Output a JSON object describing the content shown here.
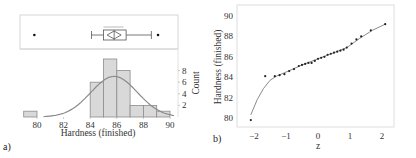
{
  "chart_data": [
    {
      "panel": "a)",
      "type": "bar",
      "title": "",
      "xlabel": "Hardness (finished)",
      "ylabel": "Count",
      "x_ticks": [
        "80",
        "82",
        "84",
        "86",
        "88",
        "90"
      ],
      "y_ticks": [
        "2",
        "4",
        "6",
        "8"
      ],
      "xlim": [
        78.5,
        90.3
      ],
      "ylim": [
        0,
        11
      ],
      "bins": [
        {
          "from": 79,
          "to": 80,
          "count": 1
        },
        {
          "from": 84,
          "to": 85,
          "count": 6
        },
        {
          "from": 85,
          "to": 86,
          "count": 10
        },
        {
          "from": 86,
          "to": 87,
          "count": 8
        },
        {
          "from": 87,
          "to": 88,
          "count": 2
        },
        {
          "from": 88,
          "to": 89,
          "count": 2
        },
        {
          "from": 89,
          "to": 90,
          "count": 1
        }
      ],
      "normal_fit": {
        "mean": 85.8,
        "sd": 1.75,
        "peak_count": 7
      },
      "boxplot": {
        "whisker_low": 84.1,
        "q1": 85.0,
        "median": 85.8,
        "q3": 86.7,
        "whisker_high": 88.6,
        "mean": 85.8,
        "outliers": [
          79.8,
          89.1
        ]
      },
      "grid": false
    },
    {
      "panel": "b)",
      "type": "scatter",
      "title": "",
      "xlabel": "z",
      "ylabel": "Hardness (finished)",
      "x_ticks": [
        "-2",
        "-1",
        "0",
        "1",
        "2"
      ],
      "y_ticks": [
        "80",
        "82",
        "84",
        "86",
        "88",
        "90"
      ],
      "xlim": [
        -2.4,
        2.4
      ],
      "ylim": [
        79.2,
        90.9
      ],
      "points": [
        {
          "z": -2.1,
          "y": 79.8
        },
        {
          "z": -1.65,
          "y": 84.1
        },
        {
          "z": -1.35,
          "y": 84.1
        },
        {
          "z": -1.2,
          "y": 84.2
        },
        {
          "z": -1.05,
          "y": 84.3
        },
        {
          "z": -0.9,
          "y": 84.6
        },
        {
          "z": -0.75,
          "y": 84.8
        },
        {
          "z": -0.6,
          "y": 85.1
        },
        {
          "z": -0.5,
          "y": 85.2
        },
        {
          "z": -0.4,
          "y": 85.3
        },
        {
          "z": -0.3,
          "y": 85.4
        },
        {
          "z": -0.2,
          "y": 85.4
        },
        {
          "z": -0.1,
          "y": 85.6
        },
        {
          "z": 0.0,
          "y": 85.8
        },
        {
          "z": 0.1,
          "y": 85.9
        },
        {
          "z": 0.2,
          "y": 86.0
        },
        {
          "z": 0.3,
          "y": 86.2
        },
        {
          "z": 0.4,
          "y": 86.3
        },
        {
          "z": 0.5,
          "y": 86.4
        },
        {
          "z": 0.6,
          "y": 86.5
        },
        {
          "z": 0.7,
          "y": 86.6
        },
        {
          "z": 0.8,
          "y": 86.7
        },
        {
          "z": 0.9,
          "y": 86.9
        },
        {
          "z": 1.05,
          "y": 87.3
        },
        {
          "z": 1.2,
          "y": 87.7
        },
        {
          "z": 1.35,
          "y": 88.0
        },
        {
          "z": 1.65,
          "y": 88.6
        },
        {
          "z": 2.1,
          "y": 89.2
        }
      ],
      "smooth_curve": [
        {
          "z": -2.1,
          "y": 80.3
        },
        {
          "z": -1.9,
          "y": 81.8
        },
        {
          "z": -1.7,
          "y": 82.9
        },
        {
          "z": -1.5,
          "y": 83.7
        },
        {
          "z": -1.3,
          "y": 84.1
        },
        {
          "z": -1.0,
          "y": 84.5
        },
        {
          "z": -0.5,
          "y": 85.2
        },
        {
          "z": 0.0,
          "y": 85.8
        },
        {
          "z": 0.5,
          "y": 86.4
        },
        {
          "z": 0.9,
          "y": 86.9
        },
        {
          "z": 1.3,
          "y": 87.8
        },
        {
          "z": 1.7,
          "y": 88.6
        },
        {
          "z": 2.1,
          "y": 89.2
        }
      ],
      "grid": false
    }
  ],
  "labels": {
    "panel_a": "a)",
    "panel_b": "b)",
    "a_xlabel": "Hardness (finished)",
    "a_ylabel": "Count",
    "b_xlabel": "z",
    "b_ylabel": "Hardness (finished)"
  },
  "colors": {
    "bar_fill": "#d9d9d9",
    "bar_stroke": "#8c8c8c",
    "curve": "#8a8a8a",
    "frame": "#d6d6d6",
    "point": "#222222"
  }
}
